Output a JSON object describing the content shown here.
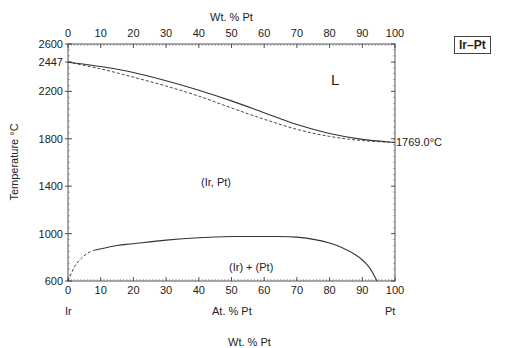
{
  "chart_data": {
    "type": "line",
    "title": "Ir–Pt",
    "system_label": "Ir–Pt",
    "xlabel": "At. % Pt",
    "xlabel_top": "Wt. % Pt",
    "xlabel_bottom_cut": "Wt. % Pt",
    "ylabel": "Temperature °C",
    "xlim": [
      0,
      100
    ],
    "ylim": [
      600,
      2600
    ],
    "x_ticks": [
      0,
      10,
      20,
      30,
      40,
      50,
      60,
      70,
      80,
      90,
      100
    ],
    "x_ticks_top": [
      0,
      10,
      20,
      30,
      40,
      50,
      60,
      70,
      80,
      90,
      100
    ],
    "y_ticks": [
      600,
      1000,
      1400,
      1800,
      2200,
      2447,
      2600
    ],
    "x_end_labels": {
      "left": "Ir",
      "right": "Pt"
    },
    "annotations": [
      {
        "text": "L",
        "x": 82,
        "y": 2330
      },
      {
        "text": "(Ir, Pt)",
        "x": 47,
        "y": 1460
      },
      {
        "text": "(Ir) + (Pt)",
        "x": 58,
        "y": 750
      },
      {
        "text": "1769.0°C",
        "x": 100,
        "y": 1769
      }
    ],
    "series": [
      {
        "name": "Liquidus",
        "style": "solid",
        "x": [
          0,
          10,
          20,
          30,
          40,
          50,
          60,
          70,
          80,
          90,
          100
        ],
        "y": [
          2447,
          2410,
          2360,
          2290,
          2210,
          2120,
          2020,
          1920,
          1845,
          1795,
          1769
        ]
      },
      {
        "name": "Solidus",
        "style": "dashed",
        "x": [
          0,
          10,
          20,
          30,
          40,
          50,
          60,
          70,
          80,
          90,
          100
        ],
        "y": [
          2447,
          2390,
          2320,
          2245,
          2160,
          2060,
          1965,
          1880,
          1820,
          1785,
          1769
        ]
      },
      {
        "name": "Miscibility gap (solid)",
        "style": "solid",
        "x": [
          8,
          15,
          20,
          30,
          40,
          50,
          60,
          70,
          80,
          88,
          92,
          94.5
        ],
        "y": [
          860,
          900,
          915,
          945,
          965,
          975,
          975,
          970,
          920,
          820,
          720,
          600
        ]
      },
      {
        "name": "Miscibility gap (dashed)",
        "style": "dashed",
        "x": [
          0,
          2,
          4,
          6,
          8
        ],
        "y": [
          600,
          720,
          790,
          835,
          860
        ]
      }
    ],
    "grid": false,
    "legend": "none"
  },
  "labels": {
    "top_axis_title": "Wt. % Pt",
    "bottom_axis_title": "At. % Pt",
    "y_axis_title": "Temperature °C",
    "left_end": "Ir",
    "right_end": "Pt",
    "badge": "Ir–Pt",
    "region_L": "L",
    "region_solid": "(Ir, Pt)",
    "region_two_phase": "(Ir) + (Pt)",
    "melting_pt": "1769.0°C",
    "bottom_cut": "Wt. % Pt"
  },
  "ticks": {
    "x": [
      "0",
      "10",
      "20",
      "30",
      "40",
      "50",
      "60",
      "70",
      "80",
      "90",
      "100"
    ],
    "y": [
      "2600",
      "2447",
      "2200",
      "1800",
      "1400",
      "1000",
      "600"
    ]
  }
}
